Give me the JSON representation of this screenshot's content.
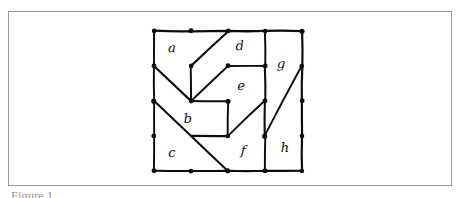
{
  "figure": {
    "caption": "Figure 1.",
    "frame": {
      "border_color": "#9a9a9a"
    },
    "ink_color": "#0d0d0d",
    "background_color": "#ffffff"
  },
  "diagram": {
    "type": "planar-subdivision",
    "region_count": 8,
    "lattice": {
      "columns_x": [
        154,
        191,
        228,
        265,
        302
      ],
      "rows_y": [
        31,
        66,
        101,
        136,
        171
      ]
    },
    "regions": [
      {
        "id": "a",
        "label": "a",
        "label_x": 172,
        "label_y": 52
      },
      {
        "id": "b",
        "label": "b",
        "label_y": 123,
        "label_x": 188
      },
      {
        "id": "c",
        "label": "c",
        "label_x": 172,
        "label_y": 157
      },
      {
        "id": "d",
        "label": "d",
        "label_x": 240,
        "label_y": 50
      },
      {
        "id": "e",
        "label": "e",
        "label_x": 241,
        "label_y": 90
      },
      {
        "id": "f",
        "label": "f",
        "label_x": 243,
        "label_y": 155
      },
      {
        "id": "g",
        "label": "g",
        "label_x": 281,
        "label_y": 68
      },
      {
        "id": "h",
        "label": "h",
        "label_x": 285,
        "label_y": 152
      }
    ],
    "boundary_nodes": [
      {
        "x": 154,
        "y": 31
      },
      {
        "x": 191,
        "y": 31
      },
      {
        "x": 228,
        "y": 31
      },
      {
        "x": 265,
        "y": 31
      },
      {
        "x": 302,
        "y": 31
      },
      {
        "x": 154,
        "y": 66
      },
      {
        "x": 302,
        "y": 66
      },
      {
        "x": 154,
        "y": 101
      },
      {
        "x": 302,
        "y": 101
      },
      {
        "x": 154,
        "y": 136
      },
      {
        "x": 302,
        "y": 136
      },
      {
        "x": 154,
        "y": 171
      },
      {
        "x": 191,
        "y": 171
      },
      {
        "x": 228,
        "y": 171
      },
      {
        "x": 265,
        "y": 171
      },
      {
        "x": 302,
        "y": 171
      }
    ],
    "interior_nodes": [
      {
        "x": 191,
        "y": 66
      },
      {
        "x": 228,
        "y": 66
      },
      {
        "x": 265,
        "y": 66
      },
      {
        "x": 191,
        "y": 101
      },
      {
        "x": 228,
        "y": 101
      },
      {
        "x": 265,
        "y": 101
      },
      {
        "x": 228,
        "y": 136
      },
      {
        "x": 265,
        "y": 136
      }
    ],
    "edges": [
      {
        "name": "outer-top",
        "points": "154,31 191,31 228,31 265,31 302,31"
      },
      {
        "name": "outer-left",
        "points": "154,31 154,66 154,101 154,136 154,171"
      },
      {
        "name": "outer-bottom",
        "points": "154,171 191,171 228,171 265,171 302,171"
      },
      {
        "name": "outer-right",
        "points": "302,31 302,66 302,101 302,136 302,171"
      },
      {
        "name": "a-d-divider",
        "points": "228,31 191,66"
      },
      {
        "name": "a-b-spur",
        "points": "191,66 191,101"
      },
      {
        "name": "left-to-hub",
        "points": "154,66 191,101"
      },
      {
        "name": "d-e-divider",
        "points": "191,101 228,66"
      },
      {
        "name": "e-top",
        "points": "228,66 265,66"
      },
      {
        "name": "d-g-divider",
        "points": "265,31 265,66"
      },
      {
        "name": "e-g-divider",
        "points": "265,66 265,101"
      },
      {
        "name": "b-e-top",
        "points": "191,101 228,101"
      },
      {
        "name": "b-e-right",
        "points": "228,101 228,136"
      },
      {
        "name": "b-f-bottom",
        "points": "191,136 228,136"
      },
      {
        "name": "c-b-diagonal",
        "points": "154,101 191,136 228,171"
      },
      {
        "name": "f-e-diagonal",
        "points": "228,136 265,101"
      },
      {
        "name": "f-g-upper",
        "points": "265,101 265,136"
      },
      {
        "name": "f-h-divider",
        "points": "265,136 265,171"
      },
      {
        "name": "g-h-diagonal",
        "points": "302,66 265,136"
      }
    ]
  }
}
